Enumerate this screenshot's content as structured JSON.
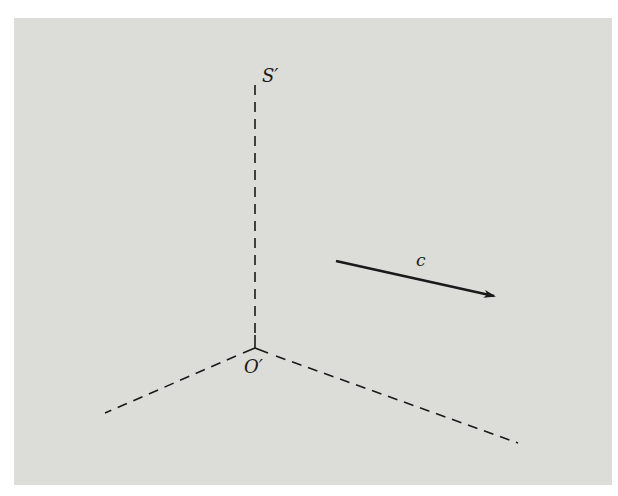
{
  "figure": {
    "background_color": "#dcdcd8",
    "line_color": "#1a1a1a",
    "labels": {
      "frame": "S′",
      "origin": "O′",
      "vector": "c"
    },
    "axes": [
      {
        "name": "vertical-axis",
        "style": "dashed",
        "from": [
          255,
          348
        ],
        "to": [
          255,
          85
        ]
      },
      {
        "name": "left-axis",
        "style": "dashed",
        "from": [
          255,
          348
        ],
        "to": [
          105,
          413
        ]
      },
      {
        "name": "right-axis",
        "style": "dashed",
        "from": [
          255,
          348
        ],
        "to": [
          518,
          443
        ]
      }
    ],
    "vector": {
      "from": [
        336,
        261
      ],
      "to": [
        496,
        296
      ]
    }
  }
}
